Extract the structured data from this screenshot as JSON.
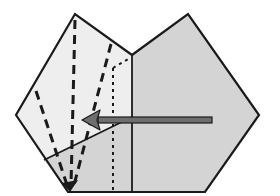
{
  "diagram": {
    "title": "Origami folding step",
    "colors": {
      "background": "#ffffff",
      "paper_front": "#eeeeee",
      "paper_back": "#d4d4d4",
      "outline": "#1a1a1a",
      "arrow_fill": "#6e6e6e",
      "arrow_stroke": "#1a1a1a"
    },
    "elements": {
      "valley_folds": "dashed lines",
      "reference_line": "dotted line",
      "arrow": "fold direction arrow pointing left"
    }
  }
}
